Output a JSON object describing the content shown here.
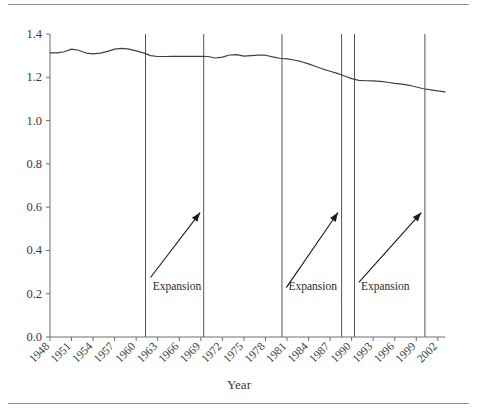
{
  "figure": {
    "top_rule": "horizontal-rule",
    "bottom_rule": "horizontal-rule"
  },
  "chart_data": {
    "type": "line",
    "title": "",
    "subtitle": "",
    "xlabel": "Year",
    "ylabel": "",
    "xlim": [
      1948,
      2003
    ],
    "ylim": [
      0.0,
      1.4
    ],
    "grid": false,
    "legend": null,
    "ytick_labels": [
      "0.0",
      "0.2",
      "0.4",
      "0.6",
      "0.8",
      "1.0",
      "1.2",
      "1.4"
    ],
    "ytick_values": [
      0.0,
      0.2,
      0.4,
      0.6,
      0.8,
      1.0,
      1.2,
      1.4
    ],
    "xtick_labels": [
      "1948",
      "1951",
      "1954",
      "1957",
      "1960",
      "1963",
      "1966",
      "1969",
      "1972",
      "1975",
      "1978",
      "1981",
      "1984",
      "1987",
      "1990",
      "1993",
      "1996",
      "1999",
      "2002"
    ],
    "xtick_values": [
      1948,
      1951,
      1954,
      1957,
      1960,
      1963,
      1966,
      1969,
      1972,
      1975,
      1978,
      1981,
      1984,
      1987,
      1990,
      1993,
      1996,
      1999,
      2002
    ],
    "xtick_rotation": 45,
    "series": [
      {
        "name": "ratio",
        "color": "#404040",
        "x": [
          1948,
          1949,
          1950,
          1951,
          1952,
          1953,
          1954,
          1955,
          1956,
          1957,
          1958,
          1959,
          1960,
          1961,
          1962,
          1963,
          1964,
          1965,
          1966,
          1967,
          1968,
          1969,
          1970,
          1971,
          1972,
          1973,
          1974,
          1975,
          1976,
          1977,
          1978,
          1979,
          1980,
          1981,
          1982,
          1983,
          1984,
          1985,
          1986,
          1987,
          1988,
          1989,
          1990,
          1991,
          1992,
          1993,
          1994,
          1995,
          1996,
          1997,
          1998,
          1999,
          2000,
          2001,
          2002,
          2003
        ],
        "y": [
          1.313,
          1.313,
          1.318,
          1.33,
          1.325,
          1.312,
          1.308,
          1.312,
          1.32,
          1.33,
          1.334,
          1.33,
          1.322,
          1.313,
          1.3,
          1.296,
          1.296,
          1.297,
          1.297,
          1.297,
          1.297,
          1.297,
          1.296,
          1.289,
          1.293,
          1.303,
          1.305,
          1.298,
          1.3,
          1.302,
          1.302,
          1.294,
          1.288,
          1.285,
          1.28,
          1.272,
          1.262,
          1.25,
          1.238,
          1.228,
          1.218,
          1.206,
          1.194,
          1.186,
          1.184,
          1.183,
          1.181,
          1.177,
          1.172,
          1.168,
          1.163,
          1.155,
          1.147,
          1.142,
          1.137,
          1.133
        ]
      }
    ],
    "vertical_lines": [
      {
        "name": "expansion-1-start",
        "x": 1961.3
      },
      {
        "name": "expansion-1-end",
        "x": 1969.4
      },
      {
        "name": "expansion-2-start",
        "x": 1980.3
      },
      {
        "name": "expansion-2-end",
        "x": 1988.6
      },
      {
        "name": "expansion-3-start",
        "x": 1990.4
      },
      {
        "name": "expansion-3-end",
        "x": 2000.2
      }
    ],
    "annotations": [
      {
        "label": "Expansion",
        "text_x": 1962.3,
        "text_y": 0.215,
        "arrow_x0": 1962.0,
        "arrow_y0": 0.275,
        "arrow_x1": 1968.9,
        "arrow_y1": 0.575
      },
      {
        "label": "Expansion",
        "text_x": 1981.2,
        "text_y": 0.215,
        "arrow_x0": 1980.9,
        "arrow_y0": 0.228,
        "arrow_x1": 1988.1,
        "arrow_y1": 0.575
      },
      {
        "label": "Expansion",
        "text_x": 1991.3,
        "text_y": 0.215,
        "arrow_x0": 1991.0,
        "arrow_y0": 0.252,
        "arrow_x1": 1999.7,
        "arrow_y1": 0.575
      }
    ]
  }
}
